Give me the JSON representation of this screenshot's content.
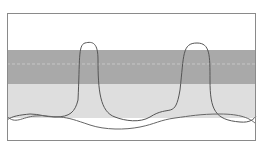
{
  "diagram": {
    "frame": {
      "x": 7,
      "y": 13,
      "width": 249,
      "height": 128,
      "stroke": "#8a8a8a"
    },
    "bands": [
      {
        "name": "upper-band",
        "y": 50,
        "height": 34,
        "fill": "#a9a9a9"
      },
      {
        "name": "lower-band",
        "y": 84,
        "height": 34,
        "fill": "#dedede"
      }
    ],
    "dashed_line": {
      "y": 64,
      "stroke": "#c8c8c8"
    },
    "curves": [
      {
        "name": "peaked-curve",
        "stroke": "#555555",
        "peaks_x": [
          83,
          195
        ]
      },
      {
        "name": "low-wave-curve",
        "stroke": "#666666"
      }
    ]
  }
}
